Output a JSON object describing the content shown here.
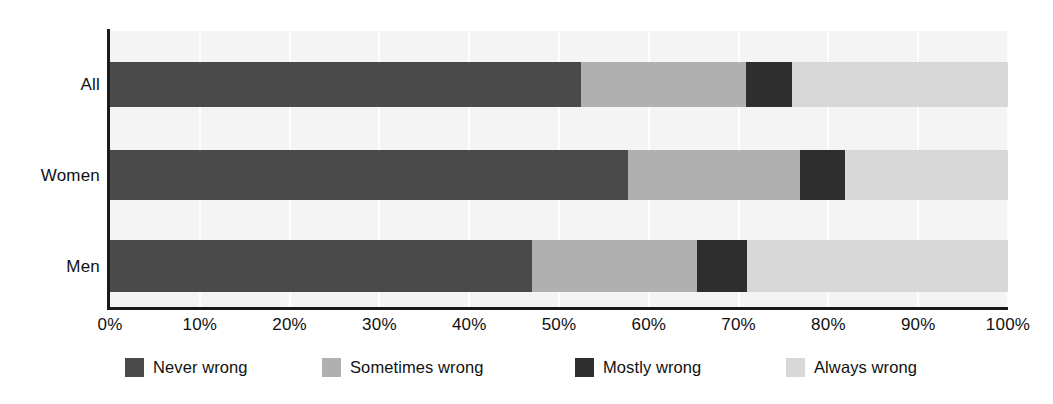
{
  "chart_data": {
    "type": "bar",
    "orientation": "horizontal",
    "stacked": true,
    "normalized": true,
    "title": "",
    "subtitle": "",
    "xlabel": "",
    "ylabel": "",
    "categories": [
      "All",
      "Women",
      "Men"
    ],
    "xlim": [
      0,
      100
    ],
    "x_tick_values": [
      0,
      10,
      20,
      30,
      40,
      50,
      60,
      70,
      80,
      90,
      100
    ],
    "x_tick_labels": [
      "0%",
      "10%",
      "20%",
      "30%",
      "40%",
      "50%",
      "60%",
      "70%",
      "80%",
      "90%",
      "100%"
    ],
    "grid": true,
    "grid_axis": "x",
    "legend_position": "bottom",
    "series": [
      {
        "name": "Never wrong",
        "color": "#4a4a4a",
        "values": [
          52.5,
          57.7,
          47.0
        ]
      },
      {
        "name": "Sometimes wrong",
        "color": "#b0b0b0",
        "values": [
          18.3,
          19.1,
          18.4
        ]
      },
      {
        "name": "Mostly wrong",
        "color": "#2e2e2e",
        "values": [
          5.2,
          5.0,
          5.5
        ]
      },
      {
        "name": "Always wrong",
        "color": "#d8d8d8",
        "values": [
          24.0,
          18.2,
          29.1
        ]
      }
    ],
    "plot_background": "#f4f4f4",
    "axis_color": "#1a1a1a"
  },
  "legend": {
    "items": [
      {
        "label": "Never wrong",
        "color": "#4a4a4a",
        "left": 15
      },
      {
        "label": "Sometimes wrong",
        "color": "#b0b0b0",
        "left": 212
      },
      {
        "label": "Mostly wrong",
        "color": "#2e2e2e",
        "left": 465
      },
      {
        "label": "Always wrong",
        "color": "#d8d8d8",
        "left": 676
      }
    ]
  },
  "layout": {
    "bars": [
      {
        "top": 62,
        "height": 45
      },
      {
        "top": 150,
        "height": 50
      },
      {
        "top": 240,
        "height": 52
      }
    ],
    "label_centers": [
      84,
      175,
      266
    ]
  }
}
